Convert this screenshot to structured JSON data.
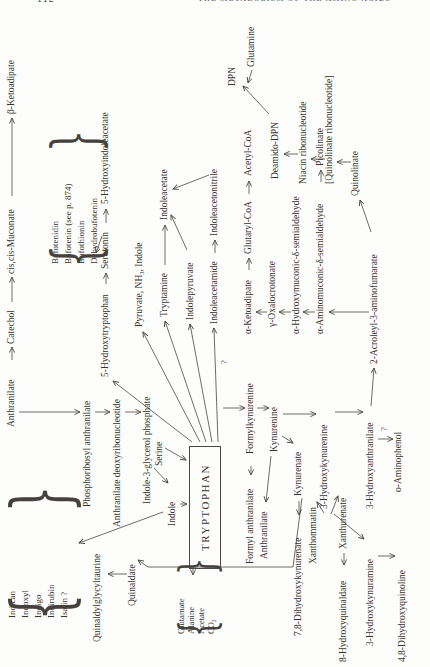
{
  "header": {
    "page_number": "112",
    "running_head": "THE METABOLISM OF THE AMINO ACIDS"
  },
  "figure": {
    "box": {
      "label": "TRYPTOPHAN",
      "x": 95,
      "y": 186,
      "w": 121,
      "h": 30
    },
    "nodes": [
      {
        "id": "anthranilate-top",
        "text": "Anthranilate",
        "x": 237,
        "y": 9
      },
      {
        "id": "catechol",
        "text": "Catechol",
        "x": 320,
        "y": 9
      },
      {
        "id": "cis-cis-muconate",
        "text": "cis,cis-Muconate",
        "x": 390,
        "y": 9
      },
      {
        "id": "beta-ketoadipate",
        "text": "β-Ketoadipate",
        "x": 550,
        "y": 9
      },
      {
        "id": "phosphoribosyl-anthranilate",
        "text": "Phosphoribosyl anthranilate",
        "x": 157,
        "y": 85
      },
      {
        "id": "anthranilate-deoxyribonucleotide",
        "text": "Anthranilate deoxyribonucleotide",
        "x": 137,
        "y": 115
      },
      {
        "id": "indole-3-glycerol-phosphate",
        "text": "Indole-3-glycerol phosphate",
        "x": 160,
        "y": 145
      },
      {
        "id": "serine",
        "text": "Serine",
        "x": 198,
        "y": 157
      },
      {
        "id": "indole",
        "text": "Indole",
        "x": 138,
        "y": 170
      },
      {
        "id": "quinaldylglycyltaurine",
        "text": "Quinaldylglycyltaurine",
        "x": 22,
        "y": 95
      },
      {
        "id": "quinaldate",
        "text": "Quinaldate",
        "x": 58,
        "y": 130
      },
      {
        "id": "5-hydroxytryptophan",
        "text": "5-Hydroxytryptophan",
        "x": 287,
        "y": 103
      },
      {
        "id": "serotonin",
        "text": "Serotonin",
        "x": 395,
        "y": 103
      },
      {
        "id": "5-hydroxyindoleacetate",
        "text": "5-Hydroxyindoleacetate",
        "x": 460,
        "y": 103
      },
      {
        "id": "pyruvate-nh3-indole",
        "text": "Pyruvate, NH₃, Indole",
        "x": 337,
        "y": 137
      },
      {
        "id": "tryptamine",
        "text": "Tryptamine",
        "x": 347,
        "y": 162
      },
      {
        "id": "indoleacetate",
        "text": "Indoleacetate",
        "x": 444,
        "y": 162
      },
      {
        "id": "indolepyruvate",
        "text": "Indolepyruvate",
        "x": 344,
        "y": 188
      },
      {
        "id": "indoleacetamide",
        "text": "Indoleacetamide",
        "x": 340,
        "y": 212
      },
      {
        "id": "indoleacetonitrile",
        "text": "Indoleacetonitrile",
        "x": 428,
        "y": 212
      },
      {
        "id": "formyl-anthranilate",
        "text": "Formyl anthranilate",
        "x": 100,
        "y": 248
      },
      {
        "id": "formylkynurenine",
        "text": "Formylkynurenine",
        "x": 210,
        "y": 248
      },
      {
        "id": "kynurenine",
        "text": "Kynurenine",
        "x": 212,
        "y": 272
      },
      {
        "id": "anthranilate",
        "text": "Anthranilate",
        "x": 105,
        "y": 262
      },
      {
        "id": "kynurenate",
        "text": "Kynurenate",
        "x": 168,
        "y": 296
      },
      {
        "id": "7-8-dihydroxykynurenate",
        "text": "7,8-Dihydroxykynurenate",
        "x": 28,
        "y": 296
      },
      {
        "id": "3-hydroxykynurenine",
        "text": "3-Hydroxykynurenine",
        "x": 155,
        "y": 322
      },
      {
        "id": "xanthommatin",
        "text": "Xanthommatin",
        "x": 100,
        "y": 311
      },
      {
        "id": "xanthurenate",
        "text": "Xanthurenate",
        "x": 115,
        "y": 341
      },
      {
        "id": "8-hydroxyquinaldate",
        "text": "8-Hydroxyquinaldate",
        "x": 2,
        "y": 341
      },
      {
        "id": "3-hydroxykynuramine",
        "text": "3-Hydroxykynuramine",
        "x": 18,
        "y": 368
      },
      {
        "id": "4-8-dihydroxyquinoline",
        "text": "4,8-Dihydroxyquinoline",
        "x": 2,
        "y": 400
      },
      {
        "id": "3-hydroxyanthranilate",
        "text": "3-Hydroxyanthranilate",
        "x": 155,
        "y": 368
      },
      {
        "id": "o-aminophenol",
        "text": "o-Aminophenol",
        "x": 172,
        "y": 396
      },
      {
        "id": "alpha-ketoadipate",
        "text": "α-Ketoadipate",
        "x": 330,
        "y": 246
      },
      {
        "id": "glutaryl-coa",
        "text": "Glutaryl-CoA",
        "x": 410,
        "y": 246
      },
      {
        "id": "acetyl-coa",
        "text": "Acetyl-CoA",
        "x": 488,
        "y": 246
      },
      {
        "id": "gamma-oxalocrotonate",
        "text": "γ-Oxalocrotonate",
        "x": 337,
        "y": 270
      },
      {
        "id": "alpha-hydroxymuconic-semialdehyde",
        "text": "α-Hydroxymuconic-δ-semialdehyde",
        "x": 330,
        "y": 294
      },
      {
        "id": "alpha-aminomuconic-semialdehyde",
        "text": "α-Aminomuconic-δ-semialdehyde",
        "x": 330,
        "y": 318
      },
      {
        "id": "picolinate",
        "text": "Picolinate",
        "x": 498,
        "y": 318
      },
      {
        "id": "2-acroleyl-3-aminofumarate",
        "text": "2-Acroleyl-3-aminofumarate",
        "x": 300,
        "y": 372
      },
      {
        "id": "quinolinate",
        "text": "Quinolinate",
        "x": 468,
        "y": 353
      },
      {
        "id": "quinolinate-ribonucleotide",
        "text": "[Quinolinate ribonucleotide]",
        "x": 480,
        "y": 327
      },
      {
        "id": "niacin-ribonucleotide",
        "text": "Niacin ribonucleotide",
        "x": 480,
        "y": 301
      },
      {
        "id": "deamido-dpn",
        "text": "Deamido-DPN",
        "x": 485,
        "y": 273
      },
      {
        "id": "dpn",
        "text": "DPN",
        "x": 578,
        "y": 230
      },
      {
        "id": "glutamine",
        "text": "Glutamine",
        "x": 597,
        "y": 249
      }
    ],
    "bracket_groups": [
      {
        "id": "indole-pigments-group",
        "x": 32,
        "y": 2,
        "w": 116,
        "h": 70,
        "item_x": 46,
        "line_h": 13,
        "font": 9,
        "items": [
          "Indican",
          "Indoxyl",
          "Indigo",
          "Indirubin",
          "Isatin ?"
        ]
      },
      {
        "id": "bufotenin-group",
        "x": 388,
        "y": 45,
        "w": 123,
        "h": 56,
        "item_x": 400,
        "line_h": 13,
        "font": 9,
        "items": [
          "Bufotenidin",
          "Bufotenin (see p. 874)",
          "Bufothionin",
          "Dehydrobufotenin"
        ]
      },
      {
        "id": "glutamate-group",
        "x": 20,
        "y": 171,
        "w": 70,
        "h": 44,
        "item_x": 30,
        "line_h": 10,
        "font": 8.5,
        "items": [
          "Glutamate",
          "Alanine",
          "Acetate",
          "CO₂"
        ]
      }
    ],
    "arrows": [
      [
        304,
        9,
        317,
        9
      ],
      [
        362,
        9,
        387,
        9
      ],
      [
        468,
        9,
        546,
        9
      ],
      [
        252,
        16,
        252,
        77
      ],
      [
        252,
        92,
        252,
        107
      ],
      [
        252,
        122,
        252,
        138
      ],
      [
        196,
        151,
        181,
        165
      ],
      [
        216,
        162,
        204,
        183
      ],
      [
        160,
        177,
        160,
        184
      ],
      [
        152,
        160,
        121,
        76
      ],
      [
        90,
        124,
        90,
        105
      ],
      [
        256,
        220,
        256,
        242
      ],
      [
        222,
        189,
        283,
        110
      ],
      [
        222,
        197,
        332,
        140
      ],
      [
        222,
        203,
        343,
        162
      ],
      [
        222,
        209,
        340,
        187
      ],
      [
        222,
        215,
        336,
        211
      ],
      [
        380,
        103,
        391,
        103
      ],
      [
        441,
        103,
        455,
        103
      ],
      [
        428,
        99,
        411,
        93
      ],
      [
        399,
        162,
        439,
        162
      ],
      [
        414,
        184,
        449,
        168
      ],
      [
        489,
        206,
        475,
        170
      ],
      [
        411,
        212,
        424,
        212
      ],
      [
        198,
        248,
        189,
        248
      ],
      [
        256,
        254,
        256,
        266
      ],
      [
        208,
        268,
        162,
        263
      ],
      [
        228,
        279,
        221,
        290
      ],
      [
        163,
        296,
        149,
        296
      ],
      [
        250,
        280,
        250,
        313
      ],
      [
        252,
        332,
        252,
        360
      ],
      [
        151,
        321,
        162,
        314
      ],
      [
        150,
        328,
        168,
        335
      ],
      [
        150,
        331,
        125,
        361
      ],
      [
        111,
        341,
        99,
        341
      ],
      [
        108,
        375,
        108,
        392
      ],
      [
        258,
        368,
        296,
        371
      ],
      [
        225,
        375,
        225,
        390
      ],
      [
        394,
        246,
        406,
        246
      ],
      [
        470,
        246,
        483,
        246
      ],
      [
        352,
        264,
        352,
        253
      ],
      [
        352,
        288,
        352,
        276
      ],
      [
        352,
        312,
        352,
        300
      ],
      [
        482,
        318,
        494,
        318
      ],
      [
        352,
        366,
        352,
        326
      ],
      [
        432,
        368,
        464,
        357
      ],
      [
        502,
        348,
        502,
        334
      ],
      [
        505,
        322,
        505,
        308
      ],
      [
        510,
        295,
        510,
        281
      ],
      [
        550,
        266,
        578,
        240
      ],
      [
        594,
        249,
        581,
        245
      ],
      [
        97,
        145,
        104,
        135
      ],
      [
        97,
        190,
        89,
        190
      ]
    ],
    "polylines": [
      [
        [
          166,
          299
        ],
        [
          97,
          290
        ],
        [
          97,
          145
        ]
      ]
    ],
    "question_marks": [
      {
        "x": 300,
        "y": 221
      },
      {
        "x": 233,
        "y": 381
      }
    ]
  }
}
